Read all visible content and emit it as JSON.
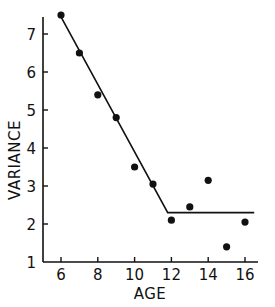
{
  "chart_data": {
    "type": "scatter",
    "title": "",
    "xlabel": "AGE",
    "ylabel": "VARIANCE",
    "xlim": [
      5,
      17
    ],
    "ylim": [
      1,
      7.6
    ],
    "x_ticks": [
      6,
      8,
      10,
      12,
      14,
      16
    ],
    "y_ticks": [
      1,
      2,
      3,
      4,
      5,
      6,
      7
    ],
    "grid": false,
    "legend": null,
    "series": [
      {
        "name": "observed",
        "kind": "scatter",
        "x": [
          6,
          7,
          8,
          9,
          10,
          11,
          12,
          13,
          14,
          15,
          16
        ],
        "y": [
          7.5,
          6.5,
          5.4,
          4.8,
          3.5,
          3.05,
          2.1,
          2.45,
          3.15,
          1.4,
          2.05
        ]
      },
      {
        "name": "fitted piecewise line",
        "kind": "line",
        "x": [
          6,
          11.8,
          16.5
        ],
        "y": [
          7.45,
          2.3,
          2.3
        ]
      }
    ]
  },
  "axes": {
    "x_title": "AGE",
    "y_title": "VARIANCE"
  },
  "colors": {
    "ink": "#111111",
    "background": "#ffffff"
  }
}
